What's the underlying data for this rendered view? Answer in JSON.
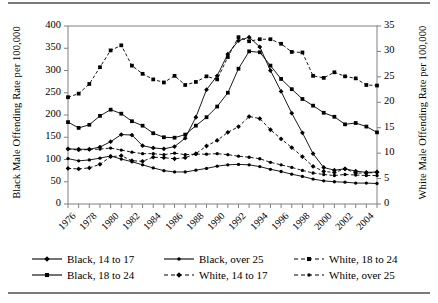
{
  "figure": {
    "left_axis_title": "Black Male Offending Rate per 100,000",
    "right_axis_title": "White Male Offending Rate per 100,000"
  },
  "legend": {
    "rows": [
      [
        {
          "label": "Black, 14 to 17",
          "symbol": "solid-diamond-icon"
        },
        {
          "label": "Black,  over 25",
          "symbol": "solid-circle-icon"
        },
        {
          "label": "White, 18 to 24",
          "symbol": "dashed-square-icon"
        }
      ],
      [
        {
          "label": "Black, 18 to 24",
          "symbol": "solid-square-icon"
        },
        {
          "label": "White, 14 to 17",
          "symbol": "dashed-diamond-icon"
        },
        {
          "label": "White,  over 25",
          "symbol": "dashed-circle-icon"
        }
      ]
    ]
  },
  "chart_data": {
    "type": "line",
    "title": "",
    "xlabel": "",
    "ylabel": "Black Male Offending Rate per 100,000",
    "y2label": "White Male Offending Rate per 100,000",
    "ylim": [
      0,
      400
    ],
    "y2lim": [
      0,
      35
    ],
    "yticks": [
      0,
      50,
      100,
      150,
      200,
      250,
      300,
      350,
      400
    ],
    "y2ticks": [
      0,
      5,
      10,
      15,
      20,
      25,
      30,
      35
    ],
    "grid": false,
    "legend_position": "bottom",
    "x": [
      1976,
      1977,
      1978,
      1979,
      1980,
      1981,
      1982,
      1983,
      1984,
      1985,
      1986,
      1987,
      1988,
      1989,
      1990,
      1991,
      1992,
      1993,
      1994,
      1995,
      1996,
      1997,
      1998,
      1999,
      2000,
      2001,
      2002,
      2003,
      2004,
      2005
    ],
    "xtick_labels": [
      "1976",
      "1978",
      "1980",
      "1982",
      "1984",
      "1986",
      "1988",
      "1990",
      "1992",
      "1994",
      "1996",
      "1998",
      "2000",
      "2002",
      "2004"
    ],
    "series": [
      {
        "name": "Black, 14 to 17",
        "axis": "left",
        "line": "solid",
        "marker": "diamond",
        "values": [
          124,
          123,
          123,
          128,
          140,
          156,
          155,
          131,
          126,
          124,
          129,
          148,
          195,
          257,
          288,
          337,
          367,
          375,
          353,
          300,
          253,
          204,
          160,
          113,
          82,
          76,
          79,
          74,
          71,
          72
        ]
      },
      {
        "name": "Black, 18 to 24",
        "axis": "left",
        "line": "solid",
        "marker": "square",
        "values": [
          184,
          171,
          178,
          198,
          212,
          203,
          186,
          176,
          159,
          150,
          149,
          156,
          176,
          195,
          219,
          250,
          304,
          343,
          341,
          311,
          281,
          258,
          236,
          221,
          205,
          196,
          179,
          182,
          174,
          161
        ]
      },
      {
        "name": "Black,  over 25",
        "axis": "left",
        "line": "solid",
        "marker": "circle",
        "values": [
          102,
          97,
          99,
          103,
          108,
          101,
          95,
          88,
          81,
          75,
          72,
          72,
          76,
          80,
          85,
          88,
          89,
          88,
          84,
          78,
          73,
          67,
          62,
          56,
          52,
          50,
          49,
          47,
          47,
          46
        ]
      },
      {
        "name": "White, 14 to 17",
        "axis": "right",
        "line": "dashed",
        "marker": "diamond",
        "values": [
          7.0,
          6.9,
          7.1,
          7.8,
          9.3,
          9.5,
          8.5,
          8.4,
          9.2,
          9.1,
          8.9,
          9.1,
          9.9,
          11.4,
          12.5,
          14.1,
          15.2,
          17.2,
          16.8,
          14.6,
          12.8,
          11.1,
          9.3,
          7.4,
          6.4,
          6.2,
          6.9,
          6.1,
          6.1,
          6.2
        ]
      },
      {
        "name": "White, 18 to 24",
        "axis": "right",
        "line": "dashed",
        "marker": "square",
        "values": [
          21.0,
          21.7,
          23.6,
          26.9,
          30.2,
          31.2,
          27.2,
          25.6,
          24.5,
          23.9,
          25.2,
          23.4,
          24.0,
          25.1,
          24.5,
          28.9,
          32.8,
          32.0,
          32.4,
          32.4,
          31.5,
          29.9,
          29.8,
          25.2,
          24.8,
          25.9,
          25.1,
          24.7,
          23.4,
          23.3
        ]
      },
      {
        "name": "White,  over 25",
        "axis": "right",
        "line": "dashed",
        "marker": "circle",
        "values": [
          10.8,
          10.6,
          10.7,
          10.8,
          11.0,
          10.6,
          10.2,
          9.9,
          9.9,
          9.7,
          10.0,
          9.7,
          9.8,
          9.8,
          9.9,
          9.7,
          9.4,
          9.2,
          8.9,
          8.2,
          7.7,
          7.2,
          6.6,
          6.1,
          5.8,
          5.6,
          5.8,
          5.7,
          5.6,
          5.6
        ]
      }
    ]
  }
}
